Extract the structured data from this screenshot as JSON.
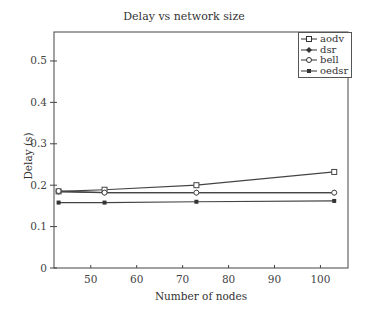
{
  "chart_data": {
    "type": "line",
    "title": "Delay vs network size",
    "xlabel": "Number of nodes",
    "ylabel": "Delay (s)",
    "x": [
      43,
      53,
      73,
      103
    ],
    "xlim": [
      42,
      106
    ],
    "ylim": [
      0,
      0.57
    ],
    "xticks": [
      "50",
      "60",
      "70",
      "80",
      "90",
      "100"
    ],
    "yticks": [
      "0",
      "0.1",
      "0.2",
      "0.3",
      "0.4",
      "0.5"
    ],
    "grid": false,
    "legend_position": "upper right",
    "series": [
      {
        "name": "aodv",
        "values": [
          0.185,
          0.189,
          0.2,
          0.232
        ],
        "marker": "square"
      },
      {
        "name": "dsr",
        "values": [
          0.184,
          0.182,
          0.182,
          0.182
        ],
        "marker": "diamond"
      },
      {
        "name": "bell",
        "values": [
          0.186,
          0.182,
          0.182,
          0.182
        ],
        "marker": "circle"
      },
      {
        "name": "oedsr",
        "values": [
          0.158,
          0.158,
          0.16,
          0.162
        ],
        "marker": "star"
      }
    ]
  }
}
